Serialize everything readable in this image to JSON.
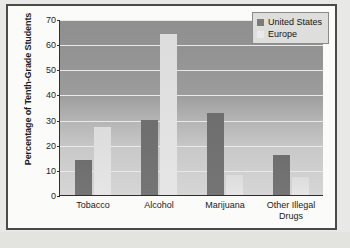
{
  "chart_data": {
    "type": "bar",
    "title": "",
    "xlabel": "",
    "ylabel": "Percentage of Tenth-Grade Students",
    "ylim": [
      0,
      70
    ],
    "ytick_step": 10,
    "yticks": [
      "70",
      "60",
      "50",
      "40",
      "30",
      "20",
      "10",
      "0"
    ],
    "grid": true,
    "legend_position": "top-right",
    "categories": [
      "Tobacco",
      "Alcohol",
      "Marijuana",
      "Other Illegal Drugs"
    ],
    "category_lines": [
      [
        "Tobacco"
      ],
      [
        "Alcohol"
      ],
      [
        "Marijuana"
      ],
      [
        "Other Illegal",
        "Drugs"
      ]
    ],
    "series": [
      {
        "name": "United States",
        "color": "#737373",
        "values": [
          14,
          30,
          32.5,
          16
        ]
      },
      {
        "name": "Europe",
        "color": "#e2e2e2",
        "values": [
          27,
          64,
          8,
          7
        ]
      }
    ]
  },
  "legend": {
    "items": [
      {
        "label": "United States",
        "swatch": "us"
      },
      {
        "label": "Europe",
        "swatch": "eu"
      }
    ]
  }
}
